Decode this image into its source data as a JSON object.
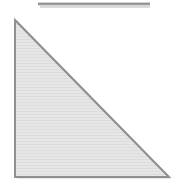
{
  "figure": {
    "title": "Right triangle figure",
    "background_color": "#ffffff",
    "width": 184,
    "height": 185,
    "top_rule": {
      "name": "horizontal rule",
      "x_start": 38,
      "x_end": 150,
      "y": 3,
      "thickness": 3,
      "color": "#8c8c8c",
      "shadow_color": "#c9c9c9"
    },
    "triangle": {
      "name": "right triangle",
      "orientation": "right angle at bottom-left",
      "vertices": [
        {
          "label": "apex",
          "x": 15,
          "y": 20
        },
        {
          "label": "bottom-left",
          "x": 15,
          "y": 177
        },
        {
          "label": "bottom-right",
          "x": 169,
          "y": 177
        }
      ],
      "fill_color": "#e4e4e4",
      "stroke_color": "#979797",
      "stroke_width": 2,
      "texture": "horizontal scanlines",
      "texture_color": "#dadada",
      "texture_spacing": 3
    }
  }
}
